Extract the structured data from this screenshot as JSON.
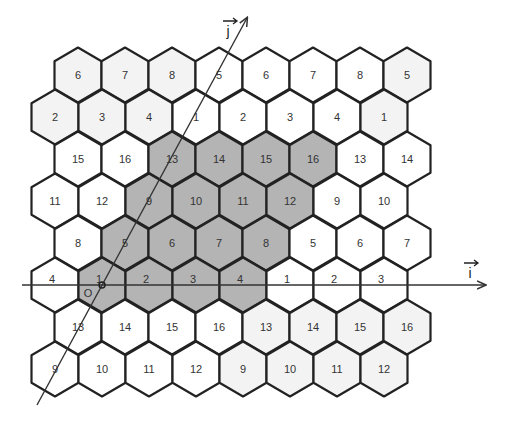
{
  "figure": {
    "width": 507,
    "height": 421,
    "colors": {
      "shaded": "#b4b4b4",
      "light": "#f3f3f3",
      "white": "#ffffff",
      "stroke": "#222222"
    },
    "grid": {
      "rows": [
        {
          "labels": [
            "6",
            "7",
            "8",
            "5",
            "6",
            "7",
            "8",
            "5"
          ],
          "shade": [
            "light",
            "light",
            "light",
            "white",
            "white",
            "white",
            "white",
            "light"
          ]
        },
        {
          "labels": [
            "2",
            "3",
            "4",
            "1",
            "2",
            "3",
            "4",
            "1"
          ],
          "shade": [
            "light",
            "light",
            "light",
            "white",
            "white",
            "white",
            "white",
            "light"
          ]
        },
        {
          "labels": [
            "15",
            "16",
            "13",
            "14",
            "15",
            "16",
            "13",
            "14"
          ],
          "shade": [
            "white",
            "white",
            "shaded",
            "shaded",
            "shaded",
            "shaded",
            "white",
            "white"
          ]
        },
        {
          "labels": [
            "11",
            "12",
            "9",
            "10",
            "11",
            "12",
            "9",
            "10"
          ],
          "shade": [
            "white",
            "white",
            "shaded",
            "shaded",
            "shaded",
            "shaded",
            "white",
            "white"
          ]
        },
        {
          "labels": [
            "8",
            "5",
            "6",
            "7",
            "8",
            "5",
            "6",
            "7"
          ],
          "shade": [
            "white",
            "shaded",
            "shaded",
            "shaded",
            "shaded",
            "white",
            "white",
            "white"
          ]
        },
        {
          "labels": [
            "4",
            "1",
            "2",
            "3",
            "4",
            "1",
            "2",
            "3"
          ],
          "shade": [
            "white",
            "shaded",
            "shaded",
            "shaded",
            "shaded",
            "white",
            "white",
            "white"
          ]
        },
        {
          "labels": [
            "13",
            "14",
            "15",
            "16",
            "13",
            "14",
            "15",
            "16"
          ],
          "shade": [
            "white",
            "white",
            "white",
            "white",
            "light",
            "light",
            "light",
            "light"
          ]
        },
        {
          "labels": [
            "9",
            "10",
            "11",
            "12",
            "9",
            "10",
            "11",
            "12"
          ],
          "shade": [
            "white",
            "white",
            "white",
            "white",
            "light",
            "light",
            "light",
            "light"
          ]
        }
      ]
    },
    "axes": {
      "i": {
        "label": "i⃗",
        "display": "i",
        "from": [
          22,
          285
        ],
        "to": [
          485,
          285
        ]
      },
      "j": {
        "label": "j⃗",
        "display": "j",
        "from": [
          37,
          405
        ],
        "to": [
          247,
          18
        ]
      },
      "origin": {
        "label": "O",
        "x": 102,
        "y": 285
      }
    }
  }
}
